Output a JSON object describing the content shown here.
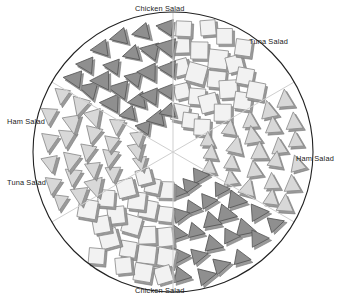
{
  "figure": {
    "kind": "circular-icon-array-chart",
    "background": "#ffffff",
    "outline_color": "#222222",
    "center_x": 173,
    "center_y": 152,
    "radius": 140
  },
  "labels": {
    "top": "Chicken Salad",
    "top_right": "Tuna Salad",
    "left": "Ham Salad",
    "right": "Ham Salad",
    "bottom_left": "Tuna Salad",
    "bottom": "Chicken Salad"
  },
  "chart_data": {
    "type": "pie",
    "title": "",
    "subtitle": "",
    "xlabel": "",
    "ylabel": "",
    "legend_position": "around-perimeter",
    "grid": false,
    "categories": [
      "Chicken Salad",
      "Tuna Salad",
      "Ham Salad"
    ],
    "values": [
      2,
      2,
      2
    ],
    "note": "Circle divided into six equal 60-degree sectors; each of the three categories occupies two opposite sectors, filled with repeated glyphs.",
    "sectors": [
      {
        "index": 0,
        "label": "Chicken Salad",
        "start_angle_deg": -90,
        "end_angle_deg": -30,
        "glyph": "square",
        "fill": "#f2f2f2",
        "stroke": "#8c8c8c",
        "glyph_count": 22,
        "label_position": "top"
      },
      {
        "index": 1,
        "label": "Tuna Salad",
        "start_angle_deg": -30,
        "end_angle_deg": 30,
        "glyph": "triangle-up",
        "fill": "#d8d8d8",
        "stroke": "#8c8c8c",
        "glyph_count": 27,
        "label_position": "top-right"
      },
      {
        "index": 2,
        "label": "Ham Salad",
        "start_angle_deg": 30,
        "end_angle_deg": 90,
        "glyph": "triangle-right",
        "fill": "#8f8f8f",
        "stroke": "#555555",
        "glyph_count": 27,
        "label_position": "right"
      },
      {
        "index": 3,
        "label": "Chicken Salad",
        "start_angle_deg": 90,
        "end_angle_deg": 150,
        "glyph": "square",
        "fill": "#f2f2f2",
        "stroke": "#8c8c8c",
        "glyph_count": 22,
        "label_position": "bottom"
      },
      {
        "index": 4,
        "label": "Tuna Salad",
        "start_angle_deg": 150,
        "end_angle_deg": 210,
        "glyph": "triangle-down",
        "fill": "#d8d8d8",
        "stroke": "#8c8c8c",
        "glyph_count": 27,
        "label_position": "bottom-left"
      },
      {
        "index": 5,
        "label": "Ham Salad",
        "start_angle_deg": 210,
        "end_angle_deg": 270,
        "glyph": "triangle-left",
        "fill": "#8f8f8f",
        "stroke": "#555555",
        "glyph_count": 27,
        "label_position": "left"
      }
    ],
    "colors": {
      "chicken_salad": "#f2f2f2",
      "tuna_salad": "#d8d8d8",
      "ham_salad": "#8f8f8f",
      "outline": "#222222",
      "glyph_shadow": "#9a9a9a"
    }
  }
}
